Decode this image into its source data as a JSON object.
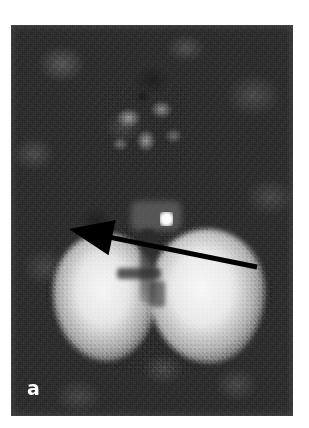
{
  "figure": {
    "panel_label": "a",
    "modality_appearance": "grayscale tomographic scan",
    "canvas": {
      "width_px": 309,
      "height_px": 428,
      "background_color": "#ffffff"
    },
    "image_plate": {
      "left_px": 11,
      "top_px": 25,
      "width_px": 282,
      "height_px": 391,
      "background_color": "#2e2e2e"
    }
  },
  "image_content": {
    "background_region": {
      "name": "noisy dark background",
      "color_low": "#1d1d1d",
      "color_high": "#4a4a4a"
    },
    "upper_structure": {
      "name": "faint midline structure",
      "center_x_px": 135,
      "center_y_px": 126,
      "peak_color": "#b4b4b4"
    },
    "uptake_region": {
      "name": "bright bilateral uptake",
      "shape": "butterfly",
      "left_lobe": {
        "center_x_px": 94,
        "center_y_px": 281,
        "peak_color": "#ffffff"
      },
      "right_lobe": {
        "center_x_px": 196,
        "center_y_px": 279,
        "peak_color": "#ffffff"
      },
      "midline_cleft": {
        "x_px": 140,
        "y_top_px": 229,
        "y_bottom_px": 303,
        "color": "#3a3a3a"
      }
    },
    "focal_hot_spot": {
      "name": "focal hyperintense lesion",
      "center_x_px": 167,
      "center_y_px": 221,
      "width_px": 13,
      "height_px": 14,
      "color": "#ffffff"
    }
  },
  "annotations": {
    "arrow": {
      "name": "pointer arrow",
      "color": "#000000",
      "tip_x_px": 58,
      "tip_y_px": 204,
      "tail_x_px": 246,
      "tail_y_px": 242,
      "head_length_px": 44,
      "head_half_width_px": 18,
      "shaft_width_px": 5,
      "points_at": "focal_hot_spot"
    }
  },
  "colors": {
    "page_background": "#ffffff",
    "plate_dark": "#2e2e2e",
    "uptake_bright": "#ffffff",
    "annotation_black": "#000000",
    "label_white": "#ffffff"
  }
}
